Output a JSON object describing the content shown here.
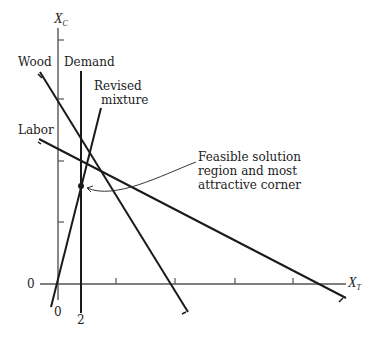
{
  "axes": {
    "y_label": "X",
    "y_label_sub": "C",
    "x_label": "X",
    "x_label_sub": "T",
    "origin_y_label": "0",
    "origin_x_label": "0",
    "x_tick_label": "2"
  },
  "lines": {
    "wood": "Wood",
    "demand": "Demand",
    "revised_line1": "Revised",
    "revised_line2": "mixture",
    "labor": "Labor"
  },
  "annotation": {
    "line1": "Feasible solution",
    "line2": "region and most",
    "line3": "attractive corner"
  },
  "colors": {
    "line": "#1a1a1a",
    "axis": "#555555",
    "background": "#ffffff"
  }
}
